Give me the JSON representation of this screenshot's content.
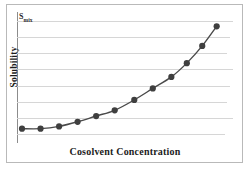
{
  "chart_data": {
    "type": "line",
    "title": "",
    "subtitle": "",
    "xlabel": "Cosolvent Concentration",
    "ylabel": "Solubility",
    "annotations": [
      {
        "text": "Smix",
        "text_base": "S",
        "text_sub": "mix",
        "position": "top-left-y-axis",
        "meaning": "maximum solubility in the cosolvent mixture"
      }
    ],
    "legend": null,
    "legend_position": "none",
    "grid": true,
    "gridlines_horizontal": 8,
    "gridlines_vertical": 0,
    "xlim": [
      0,
      1
    ],
    "ylim": [
      0,
      1
    ],
    "x_tick_labels": [],
    "y_tick_labels": [],
    "series": [
      {
        "name": "Solubility vs cosolvent concentration",
        "marker": "filled-circle",
        "marker_color": "#3f3f3f",
        "line_color": "#4a4a4a",
        "x": [
          0.0,
          0.09,
          0.18,
          0.27,
          0.36,
          0.45,
          0.545,
          0.635,
          0.725,
          0.8,
          0.875,
          0.945
        ],
        "y": [
          0.055,
          0.055,
          0.075,
          0.115,
          0.165,
          0.215,
          0.305,
          0.405,
          0.505,
          0.625,
          0.775,
          0.945
        ]
      }
    ]
  },
  "figure": {
    "axis_line_color": "#8c8c8c",
    "grid_color": "#d6d6d6",
    "frame_color": "#b9b9b9",
    "background": "#ffffff"
  }
}
